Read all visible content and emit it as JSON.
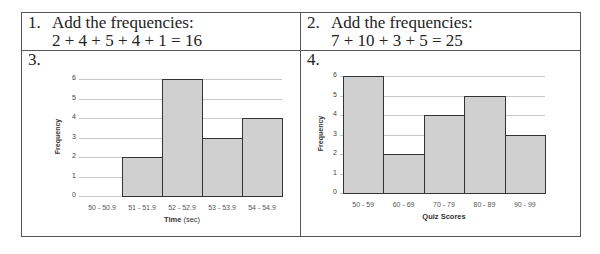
{
  "cells": [
    {
      "num": "1.",
      "line1": "Add the frequencies:",
      "line2": "2 + 4 + 5 + 4 + 1 = 16"
    },
    {
      "num": "2.",
      "line1": "Add the frequencies:",
      "line2": "7 + 10 + 3 + 5 = 25"
    },
    {
      "num": "3."
    },
    {
      "num": "4."
    }
  ],
  "chart_data": [
    {
      "type": "bar",
      "title": "",
      "xlabel": "Time (sec)",
      "xlabel_bold": "Time",
      "xlabel_rest": " (sec)",
      "ylabel": "Frequency",
      "categories": [
        "50 - 50.9",
        "51 - 51.9",
        "52 - 52.9",
        "53 - 53.9",
        "54 - 54.9"
      ],
      "values": [
        0,
        2,
        6,
        3,
        4
      ],
      "yticks": [
        "0",
        "1",
        "2",
        "3",
        "4",
        "5",
        "6"
      ],
      "ylim": [
        0,
        6
      ],
      "grid": true
    },
    {
      "type": "bar",
      "title": "",
      "xlabel": "Quiz Scores",
      "ylabel": "Frequency",
      "categories": [
        "50 - 59",
        "60 - 69",
        "70 - 79",
        "80 - 89",
        "90 - 99"
      ],
      "values": [
        6,
        2,
        4,
        5,
        3
      ],
      "yticks": [
        "0",
        "1",
        "2",
        "3",
        "4",
        "5",
        "6"
      ],
      "ylim": [
        0,
        6
      ],
      "grid": true
    }
  ]
}
